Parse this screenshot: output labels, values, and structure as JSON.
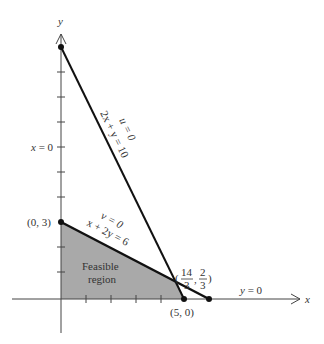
{
  "diagram": {
    "type": "linear-programming-feasible-region",
    "axes": {
      "x_label": "x",
      "y_label": "y",
      "x_axis_equation": "y = 0",
      "y_axis_equation": "x = 0"
    },
    "constraints": [
      {
        "slack": "u = 0",
        "equation": "2x + y = 10"
      },
      {
        "slack": "v = 0",
        "equation": "x + 2y = 6"
      }
    ],
    "vertices": {
      "origin_top": "(0, 3)",
      "x_intercept": "(5, 0)",
      "intersection_num1": "14",
      "intersection_den1": "3",
      "intersection_num2": "2",
      "intersection_den2": "3"
    },
    "region_label_line1": "Feasible",
    "region_label_line2": "region",
    "colors": {
      "region_fill": "#a9a9a9",
      "line": "#111111",
      "axis": "#333333"
    }
  }
}
